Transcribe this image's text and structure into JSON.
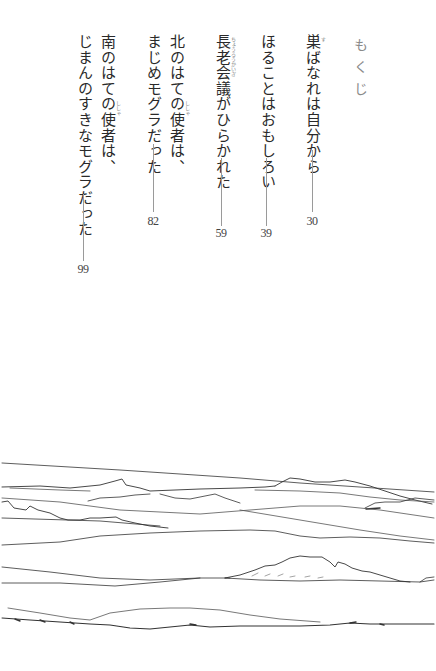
{
  "toc": {
    "heading": "もくじ",
    "entries": [
      {
        "title_lines": [
          "巣ばなれは自分から"
        ],
        "ruby": [
          {
            "base": "巣",
            "reading": "す"
          }
        ],
        "page": "30"
      },
      {
        "title_lines": [
          "ほることはおもしろい"
        ],
        "ruby": [],
        "page": "39"
      },
      {
        "title_lines": [
          "長老会議がひらかれた"
        ],
        "ruby": [
          {
            "base": "長老会議",
            "reading": "ちょうろうかいぎ"
          }
        ],
        "page": "59"
      },
      {
        "title_lines": [
          "北のはての使者は、",
          "まじめモグラだった"
        ],
        "ruby": [
          {
            "base": "使者",
            "reading": "ししゃ"
          }
        ],
        "page": "82"
      },
      {
        "title_lines": [
          "南のはての使者は、",
          "じまんのすきなモグラだった"
        ],
        "ruby": [
          {
            "base": "使者",
            "reading": "ししゃ"
          }
        ],
        "page": "99"
      }
    ]
  },
  "illustration": {
    "subject": "line-drawing-landscape",
    "description": "pen sketch of rolling hills and layered horizon lines"
  }
}
